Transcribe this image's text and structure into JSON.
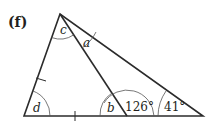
{
  "figure": {
    "label": "(f)",
    "angles": {
      "a": "a",
      "b": "b",
      "c": "c",
      "d": "d",
      "given_1": "126°",
      "given_2": "41°"
    },
    "colors": {
      "line": "#2b2b2b",
      "arc": "#555555",
      "text": "#231f20"
    }
  }
}
